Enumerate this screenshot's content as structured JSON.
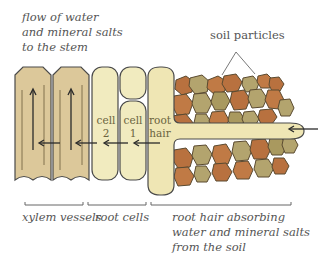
{
  "labels": {
    "flow": "flow of water\nand mineral salts\nto the stem",
    "soil_particles": "soil particles",
    "xylem_vessels": "xylem vessels",
    "root_cells": "root cells",
    "root_hair_absorbing": "root hair absorbing\nwater and mineral salts\nfrom the soil"
  },
  "cell_labels": {
    "cell2": "cell\n2",
    "cell1": "cell\n1",
    "root_hair": "root\nhair"
  },
  "colors": {
    "xylem_fill": "#dcc89a",
    "root_cell_fill": "#f1ebbf",
    "soil_brown": "#b8713f",
    "soil_olive": "#b3a46e",
    "outline": "#4a4a4a",
    "text": "#555555"
  }
}
